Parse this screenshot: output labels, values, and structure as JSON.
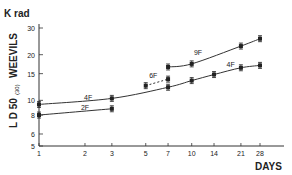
{
  "chart_data": {
    "type": "line",
    "title": "",
    "xlabel": "DAYS",
    "ylabel": "LD 50 (30) WEEVILS",
    "yunit": "K rad",
    "xscale": "log",
    "yscale": "log",
    "xlim": [
      1,
      40
    ],
    "ylim": [
      5,
      30
    ],
    "xticks": [
      1,
      2,
      3,
      5,
      7,
      10,
      14,
      21,
      28
    ],
    "yticks": [
      5,
      6,
      8,
      10,
      15,
      20,
      30
    ],
    "grid": false,
    "series": [
      {
        "name": "2F",
        "x": [
          1,
          3
        ],
        "y": [
          8.0,
          8.8
        ],
        "dashed": false
      },
      {
        "name": "4F",
        "x": [
          1,
          3,
          7,
          10,
          14,
          21,
          28
        ],
        "y": [
          9.4,
          10.3,
          12.2,
          13.5,
          14.8,
          16.4,
          17.0
        ],
        "dashed": false
      },
      {
        "name": "6F",
        "x": [
          5,
          7
        ],
        "y": [
          12.5,
          13.8
        ],
        "dashed": true
      },
      {
        "name": "9F",
        "x": [
          7,
          10,
          21,
          28
        ],
        "y": [
          16.6,
          17.4,
          22.8,
          25.5
        ],
        "dashed": false
      }
    ],
    "annotations": [
      {
        "text": "2F",
        "x": 2,
        "y": 8.6
      },
      {
        "text": "4F",
        "x": 2.1,
        "y": 10.1
      },
      {
        "text": "6F",
        "x": 5.6,
        "y": 14.0
      },
      {
        "text": "9F",
        "x": 11,
        "y": 19.8
      },
      {
        "text": "4F",
        "x": 18,
        "y": 16.6
      }
    ]
  },
  "labels": {
    "yunit": "K rad",
    "ylabel_main": "L D 50",
    "ylabel_sub": "(30)",
    "ylabel_weevils": "WEEVILS",
    "xlabel": "DAYS"
  }
}
